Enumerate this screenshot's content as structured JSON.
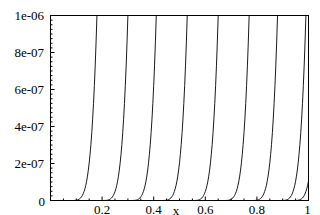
{
  "chart_data": {
    "type": "line",
    "title": "",
    "xlabel": "x",
    "ylabel": "",
    "xlim": [
      0,
      1
    ],
    "ylim": [
      0,
      1e-06
    ],
    "grid": false,
    "legend": null,
    "x_ticks": [
      "0.2",
      "0.4",
      "0.6",
      "0.8",
      "1"
    ],
    "x_tick_values": [
      0.2,
      0.4,
      0.6,
      0.8,
      1.0
    ],
    "y_ticks": [
      "0",
      "2e-07",
      "4e-07",
      "6e-07",
      "8e-07",
      "1e-06"
    ],
    "y_tick_values": [
      0,
      2e-07,
      4e-07,
      6e-07,
      8e-07,
      1e-06
    ],
    "origin_label": "0",
    "curve_model": "y = 1e-6 * max(0,(x - s)/w)^p, clipped at top",
    "curve_exponent": 5,
    "curve_width": 0.11,
    "series": [
      {
        "name": "curve 1",
        "top_crossing_x": 0.18,
        "value_at_x1": null
      },
      {
        "name": "curve 2",
        "top_crossing_x": 0.3,
        "value_at_x1": null
      },
      {
        "name": "curve 3",
        "top_crossing_x": 0.41,
        "value_at_x1": null
      },
      {
        "name": "curve 4",
        "top_crossing_x": 0.53,
        "value_at_x1": null
      },
      {
        "name": "curve 5",
        "top_crossing_x": 0.65,
        "value_at_x1": null
      },
      {
        "name": "curve 6",
        "top_crossing_x": 0.77,
        "value_at_x1": null
      },
      {
        "name": "curve 7",
        "top_crossing_x": 0.88,
        "value_at_x1": null
      },
      {
        "name": "curve 8",
        "top_crossing_x": 0.99,
        "value_at_x1": null
      },
      {
        "name": "curve 9",
        "top_crossing_x": 1.04,
        "value_at_x1": 1.5e-07
      }
    ]
  }
}
